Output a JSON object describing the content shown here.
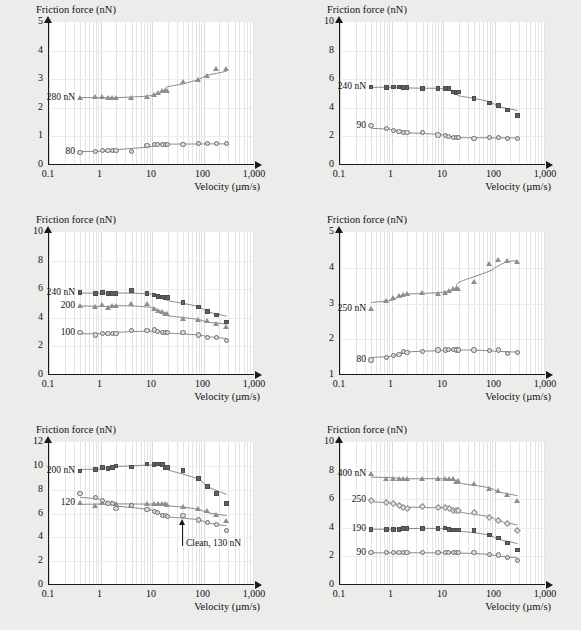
{
  "figure": {
    "background_color": "#ececeb",
    "panel_background": "#ffffff",
    "axis_color": "#1a1a1a",
    "xlabel": "Velocity (µm/s)",
    "ylabel": "Friction force (nN)"
  },
  "chart_data": [
    {
      "type": "scatter",
      "title": "HDT",
      "xlabel": "Velocity (µm/s)",
      "ylabel": "Friction force (nN)",
      "xscale": "log",
      "xlim": [
        0.1,
        1000
      ],
      "ylim": [
        0,
        5
      ],
      "xticks": [
        "0.1",
        "1",
        "10",
        "100",
        "1,000"
      ],
      "yticks": [
        "0",
        "1",
        "2",
        "3",
        "4",
        "5"
      ],
      "grid": true,
      "legend_position": "inline-left",
      "series": [
        {
          "name": "280 nN",
          "label": "280 nN",
          "marker": "triangle",
          "color": "#8d8d96",
          "x": [
            0.4,
            0.8,
            1.1,
            1.4,
            1.7,
            2.0,
            4.0,
            8.0,
            11,
            13,
            16,
            18,
            20,
            40,
            80,
            120,
            180,
            280
          ],
          "y": [
            2.33,
            2.37,
            2.37,
            2.35,
            2.35,
            2.35,
            2.35,
            2.38,
            2.45,
            2.52,
            2.6,
            2.6,
            2.6,
            2.9,
            2.97,
            3.12,
            3.37,
            3.35
          ]
        },
        {
          "name": "80",
          "label": "80",
          "marker": "circle",
          "color": "#d9d9d9",
          "x": [
            0.4,
            0.8,
            1.1,
            1.4,
            1.7,
            2.0,
            4.0,
            8.0,
            11,
            13,
            16,
            18,
            20,
            40,
            80,
            120,
            180,
            280
          ],
          "y": [
            0.44,
            0.47,
            0.5,
            0.5,
            0.5,
            0.52,
            0.48,
            0.67,
            0.72,
            0.73,
            0.73,
            0.73,
            0.72,
            0.73,
            0.74,
            0.74,
            0.74,
            0.74
          ]
        }
      ]
    },
    {
      "type": "scatter",
      "title": "BPT",
      "xlabel": "Velocity (µm/s)",
      "ylabel": "Friction force (nN)",
      "xscale": "log",
      "xlim": [
        0.1,
        1000
      ],
      "ylim": [
        0,
        10
      ],
      "xticks": [
        "0.1",
        "1",
        "10",
        "100",
        "1,000"
      ],
      "yticks": [
        "0",
        "2",
        "4",
        "6",
        "8",
        "10"
      ],
      "grid": true,
      "legend_position": "inline-left",
      "series": [
        {
          "name": "240 nN",
          "label": "240 nN",
          "marker": "square",
          "color": "#616168",
          "x": [
            0.4,
            0.8,
            1.1,
            1.4,
            1.7,
            2.0,
            4.0,
            8.0,
            11,
            13,
            16,
            18,
            20,
            40,
            80,
            120,
            180,
            280
          ],
          "y": [
            5.45,
            5.4,
            5.45,
            5.45,
            5.4,
            5.4,
            5.35,
            5.35,
            5.35,
            5.35,
            5.1,
            5.05,
            5.1,
            4.65,
            4.35,
            4.15,
            3.85,
            3.45
          ]
        },
        {
          "name": "90",
          "label": "90",
          "marker": "circle",
          "color": "#d9d9d9",
          "x": [
            0.4,
            0.8,
            1.1,
            1.4,
            1.7,
            2.0,
            4.0,
            8.0,
            11,
            13,
            16,
            18,
            20,
            40,
            80,
            120,
            180,
            280
          ],
          "y": [
            2.75,
            2.55,
            2.4,
            2.35,
            2.3,
            2.3,
            2.25,
            2.1,
            2.05,
            2.0,
            1.95,
            1.9,
            1.9,
            1.85,
            1.95,
            1.95,
            1.85,
            1.85
          ]
        }
      ]
    },
    {
      "type": "scatter",
      "title": "BPTC",
      "xlabel": "Velocity (µm/s)",
      "ylabel": "Friction force (nN)",
      "xscale": "log",
      "xlim": [
        0.1,
        1000
      ],
      "ylim": [
        0,
        10
      ],
      "xticks": [
        "0.1",
        "1",
        "10",
        "100",
        "1,000"
      ],
      "yticks": [
        "0",
        "2",
        "4",
        "6",
        "8",
        "10"
      ],
      "grid": true,
      "legend_position": "inline-left",
      "series": [
        {
          "name": "240 nN",
          "label": "240 nN",
          "marker": "square",
          "color": "#616168",
          "x": [
            0.4,
            0.8,
            1.1,
            1.4,
            1.7,
            2.0,
            4.0,
            8.0,
            11,
            13,
            16,
            18,
            20,
            40,
            80,
            120,
            180,
            280
          ],
          "y": [
            5.75,
            5.7,
            5.75,
            5.7,
            5.7,
            5.7,
            5.9,
            5.7,
            5.6,
            5.5,
            5.45,
            5.4,
            5.4,
            5.05,
            4.75,
            4.45,
            4.2,
            3.7
          ]
        },
        {
          "name": "200",
          "label": "200",
          "marker": "triangle",
          "color": "#8d8d96",
          "x": [
            0.4,
            0.8,
            1.1,
            1.4,
            1.7,
            2.0,
            4.0,
            8.0,
            11,
            13,
            16,
            18,
            20,
            40,
            80,
            120,
            180,
            280
          ],
          "y": [
            4.85,
            4.75,
            4.9,
            4.7,
            4.8,
            4.8,
            5.0,
            4.95,
            4.6,
            4.45,
            4.4,
            4.3,
            4.3,
            3.9,
            3.85,
            3.75,
            3.6,
            3.35
          ]
        },
        {
          "name": "100",
          "label": "100",
          "marker": "circle",
          "color": "#d9d9d9",
          "x": [
            0.4,
            0.8,
            1.1,
            1.4,
            1.7,
            2.0,
            4.0,
            8.0,
            11,
            13,
            16,
            18,
            20,
            40,
            80,
            120,
            180,
            280
          ],
          "y": [
            2.95,
            2.8,
            2.9,
            2.9,
            2.9,
            2.9,
            3.1,
            3.1,
            3.15,
            3.05,
            2.95,
            2.95,
            2.95,
            3.0,
            2.8,
            2.65,
            2.6,
            2.4
          ]
        }
      ]
    },
    {
      "type": "scatter",
      "title": "MHA",
      "xlabel": "Velocity (µm/s)",
      "ylabel": "Friction force (nN)",
      "xscale": "log",
      "xlim": [
        0.1,
        1000
      ],
      "ylim": [
        1,
        5
      ],
      "xticks": [
        "0.1",
        "1",
        "10",
        "100",
        "1,000"
      ],
      "yticks": [
        "1",
        "2",
        "3",
        "4",
        "5"
      ],
      "grid": true,
      "legend_position": "inline-left",
      "series": [
        {
          "name": "250 nN",
          "label": "250 nN",
          "marker": "triangle",
          "color": "#8d8d96",
          "x": [
            0.4,
            0.8,
            1.1,
            1.4,
            1.7,
            2.0,
            4.0,
            8.0,
            11,
            13,
            16,
            18,
            20,
            40,
            80,
            120,
            180,
            280
          ],
          "y": [
            2.85,
            3.08,
            3.15,
            3.2,
            3.25,
            3.28,
            3.3,
            3.28,
            3.3,
            3.35,
            3.4,
            3.4,
            3.42,
            3.6,
            4.1,
            4.22,
            4.2,
            4.17
          ]
        },
        {
          "name": "80",
          "label": "80",
          "marker": "circle",
          "color": "#d9d9d9",
          "x": [
            0.4,
            0.8,
            1.1,
            1.4,
            1.7,
            2.0,
            4.0,
            8.0,
            11,
            13,
            16,
            18,
            20,
            40,
            80,
            120,
            180,
            280
          ],
          "y": [
            1.42,
            1.5,
            1.55,
            1.58,
            1.65,
            1.63,
            1.65,
            1.7,
            1.7,
            1.72,
            1.72,
            1.7,
            1.7,
            1.7,
            1.68,
            1.7,
            1.6,
            1.62
          ]
        }
      ]
    },
    {
      "type": "scatter",
      "title": "Si(111)",
      "xlabel": "Velocity (µm/s)",
      "ylabel": "Friction force (nN)",
      "xscale": "log",
      "xlim": [
        0.1,
        1000
      ],
      "ylim": [
        0,
        12
      ],
      "xticks": [
        "0.1",
        "1",
        "10",
        "100",
        "1,000"
      ],
      "yticks": [
        "0",
        "2",
        "4",
        "6",
        "8",
        "10",
        "12"
      ],
      "grid": true,
      "legend_position": "inline-left",
      "annotation": "Clean, 130 nN",
      "series": [
        {
          "name": "200 nN",
          "label": "200 nN",
          "marker": "square",
          "color": "#616168",
          "x": [
            0.4,
            0.8,
            1.1,
            1.4,
            1.7,
            2.0,
            4.0,
            8.0,
            11,
            13,
            16,
            18,
            20,
            40,
            80,
            120,
            180,
            280
          ],
          "y": [
            9.55,
            9.7,
            9.85,
            9.8,
            9.85,
            10.0,
            9.9,
            10.15,
            10.1,
            10.15,
            10.1,
            9.85,
            9.85,
            9.6,
            8.95,
            8.25,
            7.7,
            6.85
          ]
        },
        {
          "name": "120",
          "label": "120",
          "marker": "triangle",
          "color": "#8d8d96",
          "x": [
            0.4,
            0.8,
            1.1,
            1.4,
            1.7,
            2.0,
            4.0,
            8.0,
            11,
            13,
            16,
            18,
            20,
            40,
            80,
            120,
            180,
            280
          ],
          "y": [
            6.85,
            6.6,
            6.85,
            6.85,
            6.85,
            6.8,
            6.75,
            6.8,
            6.8,
            6.8,
            6.8,
            6.8,
            6.75,
            6.55,
            6.35,
            6.2,
            5.85,
            5.4
          ]
        },
        {
          "name": "Clean, 130 nN",
          "label": "",
          "marker": "circle",
          "color": "#d9d9d9",
          "x": [
            0.4,
            0.8,
            1.1,
            1.4,
            1.7,
            2.0,
            4.0,
            8.0,
            11,
            13,
            16,
            18,
            20,
            40,
            80,
            120,
            180,
            280
          ],
          "y": [
            7.65,
            7.35,
            7.1,
            6.85,
            6.85,
            6.45,
            6.65,
            6.35,
            6.2,
            6.1,
            5.85,
            5.8,
            5.75,
            5.8,
            5.45,
            5.25,
            5.1,
            4.55
          ]
        }
      ]
    },
    {
      "type": "scatter",
      "title": "DHBp",
      "xlabel": "Velocity (µm/s)",
      "ylabel": "Friction force (nN)",
      "xscale": "log",
      "xlim": [
        0.1,
        1000
      ],
      "ylim": [
        0,
        10
      ],
      "xticks": [
        "0.1",
        "1",
        "10",
        "100",
        "1,000"
      ],
      "yticks": [
        "0",
        "2",
        "4",
        "6",
        "8",
        "10"
      ],
      "grid": true,
      "legend_position": "inline-left",
      "series": [
        {
          "name": "400 nN",
          "label": "400 nN",
          "marker": "triangle",
          "color": "#8d8d96",
          "x": [
            0.4,
            0.8,
            1.1,
            1.4,
            1.7,
            2.0,
            4.0,
            8.0,
            11,
            13,
            16,
            18,
            20,
            40,
            80,
            120,
            180,
            280
          ],
          "y": [
            7.75,
            7.45,
            7.45,
            7.4,
            7.45,
            7.45,
            7.4,
            7.42,
            7.45,
            7.42,
            7.4,
            7.2,
            7.25,
            7.05,
            6.75,
            6.6,
            6.3,
            5.85
          ]
        },
        {
          "name": "250",
          "label": "250",
          "marker": "diamond",
          "color": "#e2e2e2",
          "x": [
            0.4,
            0.8,
            1.1,
            1.4,
            1.7,
            2.0,
            4.0,
            8.0,
            11,
            13,
            16,
            18,
            20,
            40,
            80,
            120,
            180,
            280
          ],
          "y": [
            5.95,
            5.8,
            5.7,
            5.6,
            5.45,
            5.35,
            5.5,
            5.4,
            5.4,
            5.35,
            5.25,
            5.2,
            5.2,
            5.1,
            4.75,
            4.5,
            4.3,
            3.8
          ]
        },
        {
          "name": "190",
          "label": "190",
          "marker": "square",
          "color": "#616168",
          "x": [
            0.4,
            0.8,
            1.1,
            1.4,
            1.7,
            2.0,
            4.0,
            8.0,
            11,
            13,
            16,
            18,
            20,
            40,
            80,
            120,
            180,
            280
          ],
          "y": [
            3.9,
            3.9,
            3.9,
            3.9,
            3.95,
            3.95,
            3.95,
            3.95,
            4.0,
            3.9,
            3.85,
            3.85,
            3.85,
            3.8,
            3.5,
            3.3,
            2.95,
            2.45
          ]
        },
        {
          "name": "90",
          "label": "90",
          "marker": "circle",
          "color": "#d9d9d9",
          "x": [
            0.4,
            0.8,
            1.1,
            1.4,
            1.7,
            2.0,
            4.0,
            8.0,
            11,
            13,
            16,
            18,
            20,
            40,
            80,
            120,
            180,
            280
          ],
          "y": [
            2.25,
            2.25,
            2.25,
            2.25,
            2.25,
            2.25,
            2.25,
            2.25,
            2.25,
            2.25,
            2.25,
            2.25,
            2.25,
            2.25,
            2.15,
            2.1,
            1.9,
            1.7
          ]
        }
      ]
    }
  ]
}
